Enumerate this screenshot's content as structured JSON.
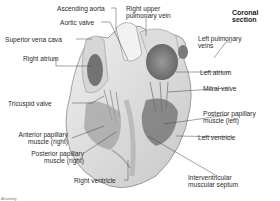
{
  "diagram": {
    "title": "Coronal section",
    "credit": "Anatomy",
    "labels": {
      "ascending_aorta": "Ascending aorta",
      "aortic_valve": "Aortic valve",
      "superior_vena_cava": "Superior vena cava",
      "right_atrium": "Right atrium",
      "tricuspid_valve": "Tricuspid valve",
      "anterior_papillary_right_1": "Anterior papillary",
      "anterior_papillary_right_2": "muscle (right)",
      "posterior_papillary_right_1": "Posterior papillary",
      "posterior_papillary_right_2": "muscle (right)",
      "right_ventricle": "Right ventricle",
      "right_upper_pulmonary_vein_1": "Right upper",
      "right_upper_pulmonary_vein_2": "pulmonary vein",
      "left_pulmonary_veins_1": "Left pulmonary",
      "left_pulmonary_veins_2": "veins",
      "left_atrium": "Left atrium",
      "mitral_valve": "Mitral valve",
      "posterior_papillary_left_1": "Posterior papillary",
      "posterior_papillary_left_2": "muscle (left)",
      "left_ventricle": "Left ventricle",
      "interventricular_septum_1": "Interventricular",
      "interventricular_septum_2": "muscular septum"
    },
    "colors": {
      "tissue_light": "#e4e4e4",
      "tissue_mid": "#bdbdbd",
      "tissue_dark": "#5a5a5a",
      "leader": "#444444"
    }
  }
}
